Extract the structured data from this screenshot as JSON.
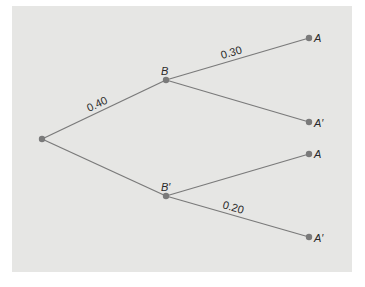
{
  "diagram": {
    "type": "probability-tree",
    "colors": {
      "background": "#e6e6e4",
      "line": "#7a7a7a",
      "node": "#7a7a7a",
      "text": "#2a2a2a"
    },
    "nodes": {
      "root": {
        "label": ""
      },
      "b": {
        "label": "B"
      },
      "b_prime": {
        "label": "B′"
      },
      "leaf1": {
        "label": "A"
      },
      "leaf2": {
        "label": "A′"
      },
      "leaf3": {
        "label": "A"
      },
      "leaf4": {
        "label": "A′"
      }
    },
    "edges": {
      "root_b": {
        "label": "0.40"
      },
      "root_bprime": {
        "label": ""
      },
      "b_a": {
        "label": "0.30"
      },
      "b_aprime": {
        "label": ""
      },
      "bprime_a": {
        "label": ""
      },
      "bprime_aprime": {
        "label": "0.20"
      }
    }
  }
}
